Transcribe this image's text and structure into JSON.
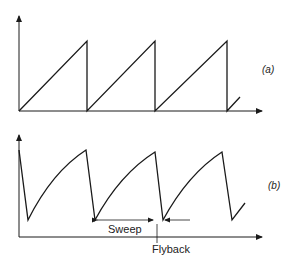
{
  "diagram": {
    "panel_a": {
      "label": "(a)",
      "description": "Linear sawtooth waveform",
      "points": [
        [
          19,
          111
        ],
        [
          87,
          41
        ],
        [
          87,
          111
        ],
        [
          155,
          41
        ],
        [
          155,
          111
        ],
        [
          227,
          41
        ],
        [
          227,
          111
        ],
        [
          240,
          97
        ]
      ]
    },
    "panel_b": {
      "label": "(b)",
      "description": "Exponential (RC charging) sawtooth waveform",
      "annotations": {
        "sweep": "Sweep",
        "flyback": "Flyback"
      }
    },
    "colors": {
      "line": "#1a1a1a",
      "background": "#ffffff"
    }
  }
}
